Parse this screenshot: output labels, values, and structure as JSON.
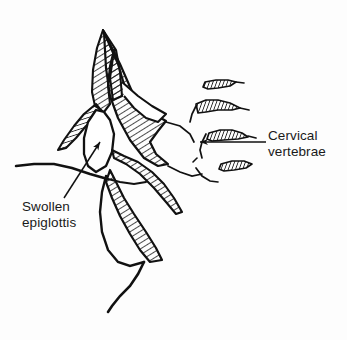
{
  "figure": {
    "kind": "line-drawing",
    "background_color": "#fdfdfd",
    "ink_color": "#111111"
  },
  "labels": {
    "cervical": {
      "line1": "Cervical",
      "line2": "vertebrae",
      "leader": "horizontal-line-with-left-arrowhead"
    },
    "epiglottis": {
      "line1": "Swollen",
      "line2": "epiglottis",
      "leader": "diagonal-line-with-up-right-arrowhead"
    }
  },
  "structures": [
    {
      "name": "soft-palate-nasopharynx",
      "style": "hatched"
    },
    {
      "name": "swollen-epiglottis",
      "style": "outline"
    },
    {
      "name": "uvula-flap",
      "style": "hatched"
    },
    {
      "name": "pharyngeal-wall-mass",
      "style": "hatched"
    },
    {
      "name": "tongue-base",
      "style": "hatched"
    },
    {
      "name": "aryepiglottic-fold",
      "style": "hatched"
    },
    {
      "name": "anterior-neck-contour",
      "style": "outline"
    },
    {
      "name": "cervical-vertebra-1",
      "style": "hatched"
    },
    {
      "name": "cervical-vertebra-2",
      "style": "hatched"
    },
    {
      "name": "cervical-vertebra-3",
      "style": "hatched"
    },
    {
      "name": "cervical-vertebra-4",
      "style": "hatched"
    }
  ]
}
